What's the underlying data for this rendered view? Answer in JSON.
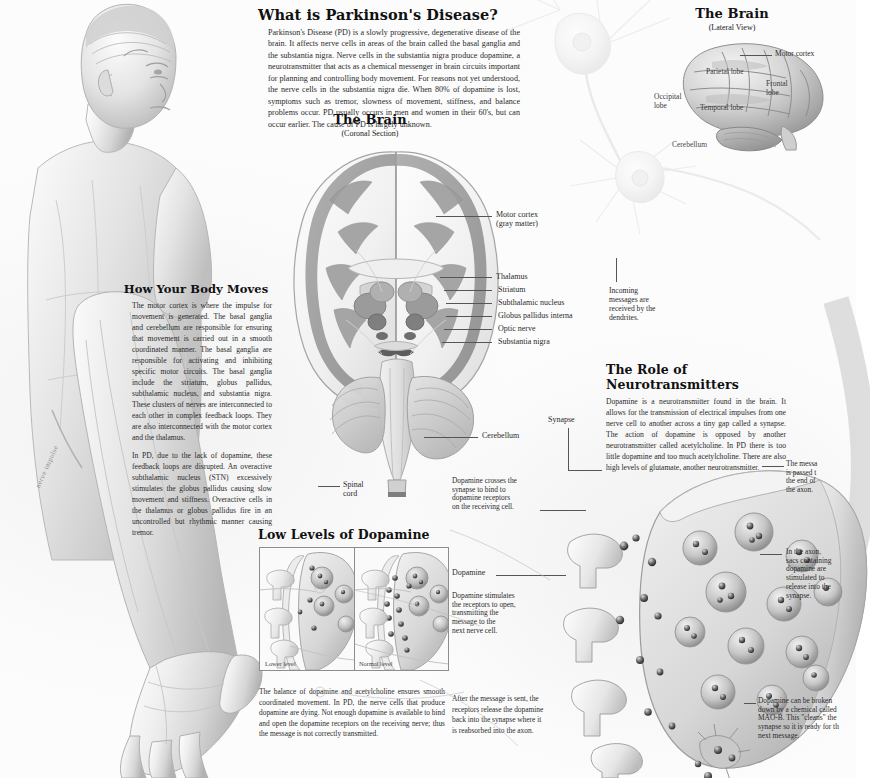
{
  "poster": {
    "title": "Parkinson's Disease Medical Illustration Poster",
    "palette": {
      "ink": "#1a1a1a",
      "body_text": "#2a2a2a",
      "leader_line": "#555555",
      "panel_border": "#8d8d8d",
      "background": "#fcfcfc",
      "gray_matter": "#9a9a9a",
      "white_matter": "#e8e8e8",
      "deep_nuclei": "#6f6f6f"
    }
  },
  "sections": {
    "what_is_pd": {
      "heading": "What is Parkinson's Disease?",
      "paragraph": "Parkinson's Disease (PD) is a slowly progressive, degenerative disease of the brain. It affects nerve cells in areas of the brain called the basal ganglia and the substantia nigra. Nerve cells in the substantia nigra produce dopamine, a neurotransmitter that acts as a chemical messenger in brain circuits important for planning and controlling body movement. For reasons not yet understood, the nerve cells in the substantia nigra die. When 80% of dopamine is lost, symptoms such as tremor, slowness of movement, stiffness, and balance problems occur. PD usually occurs in men and women in their 60's, but can occur earlier. The cause of PD is largely unknown."
    },
    "how_body_moves": {
      "heading": "How Your Body Moves",
      "paragraph_1": "The motor cortex is where the impulse for movement is generated. The basal ganglia and cerebellum are responsible for ensuring that movement is carried out in a smooth coordinated manner. The basal ganglia are responsible for activating and inhibiting specific motor circuits. The basal ganglia include the striatum, globus pallidus, subthalamic nucleus, and substantia nigra. These clusters of nerves are interconnected to each other in complex feedback loops. They are also interconnected with the motor cortex and the thalamus.",
      "paragraph_2": "In PD, due to the lack of dopamine, these feedback loops are disrupted. An overactive subthalamic nucleus (STN) excessively stimulates the globus pallidus causing slow movement and stiffness. Overactive cells in the thalamus or globus pallidus fire in an uncontrolled but rhythmic manner causing tremor."
    },
    "neurotransmitters": {
      "heading": "The Role of Neurotransmitters",
      "paragraph": "Dopamine is a neurotransmitter found in the brain. It allows for the transmission of electrical impulses from one nerve cell to another across a tiny gap called a synapse. The action of dopamine is opposed by another neurotransmitter called acetylcholine. In PD there is too little dopamine and too much acetylcholine. There are also high levels of glutamate, another neurotransmitter."
    },
    "low_dopamine": {
      "heading": "Low Levels of Dopamine",
      "panel_left_caption": "Lower level",
      "panel_right_caption": "Normal level",
      "paragraph": "The balance of dopamine and acetylcholine ensures smooth coordinated movement. In PD, the nerve cells that produce dopamine are dying. Not enough dopamine is available to bind and open the dopamine receptors on the receiving nerve; thus the message is not correctly transmitted."
    }
  },
  "figures": {
    "coronal_brain": {
      "title": "The Brain",
      "subtitle": "(Coronal Section)",
      "labels": [
        "Motor cortex\n(gray matter)",
        "Thalamus",
        "Striatum",
        "Subthalamic nucleus",
        "Globus pallidus interna",
        "Optic nerve",
        "Substantia  nigra",
        "Cerebellum",
        "Spinal\ncord"
      ]
    },
    "lateral_brain": {
      "title": "The Brain",
      "subtitle": "(Lateral View)",
      "labels": [
        "Motor cortex",
        "Parietal lobe",
        "Frontal\nlobe",
        "Occipital\nlobe",
        "Temporal lobe",
        "Cerebellum"
      ]
    },
    "body_figure": {
      "annotation": "nerve impulse"
    },
    "neuron": {
      "dendrite_note": "Incoming\nmessages are\nreceived by the\ndendrites."
    },
    "synapse": {
      "label_synapse": "Synapse",
      "label_dopamine": "Dopamine",
      "note_crosses": "Dopamine crosses the\nsynapse to bind to\ndopamine receptors\non the receiving cell.",
      "note_stimulates": "Dopamine stimulates\nthe receptors to open,\ntransmitting the\nmessage to the\nnext nerve cell.",
      "note_reuptake": "After the message is sent, the\nreceptors release the dopamine\nback into the synapse where it\nis reabsorbed into the axon.",
      "note_axon_end": "The messa\nis passed t\nthe end of\nthe axon.",
      "note_vesicles": "In the axon,\nsacs containing\ndopamine are\nstimulated to\n release into the\nsynapse.",
      "note_mao": "Dopamine can be broken\ndown by a chemical called\nMAO-B. This \"cleans\" the\nsynapse so it is ready for th\nnext message."
    }
  }
}
